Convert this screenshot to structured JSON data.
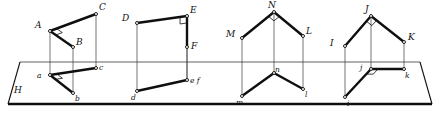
{
  "figure": {
    "plane_label": "H",
    "colors": {
      "ink": "#0f0f0f",
      "thin_line": "#3a3a3a",
      "background": "#ffffff"
    }
  },
  "plane": {
    "name": "horizontal-projection-plane",
    "label": "H",
    "top_edge": {
      "x1": 20,
      "y1": 62,
      "x2": 420,
      "y2": 62
    },
    "bottom_edge": {
      "x1": 8,
      "y1": 104,
      "x2": 432,
      "y2": 104
    },
    "left_edge": {
      "x1": 20,
      "y1": 62,
      "x2": 8,
      "y2": 104
    },
    "right_edge": {
      "x1": 420,
      "y1": 62,
      "x2": 432,
      "y2": 104
    },
    "label_pos": {
      "x": 14,
      "y": 92
    }
  },
  "groups": [
    {
      "id": "group-abc",
      "upper": {
        "vertices": [
          {
            "name": "A",
            "x": 50,
            "y": 31,
            "label_dx": -10,
            "label_dy": -4
          },
          {
            "name": "B",
            "x": 73,
            "y": 47,
            "label_dx": 3,
            "label_dy": -3
          },
          {
            "name": "C",
            "x": 96,
            "y": 14,
            "label_dx": 3,
            "label_dy": -5
          }
        ],
        "thick_edges": [
          [
            "A",
            "C"
          ],
          [
            "A",
            "B"
          ]
        ],
        "right_angle_at": "A"
      },
      "lower": {
        "vertices": [
          {
            "name": "a",
            "x": 50,
            "y": 75,
            "label_dx": -9,
            "label_dy": 2
          },
          {
            "name": "b",
            "x": 73,
            "y": 93,
            "label_dx": 2,
            "label_dy": 7
          },
          {
            "name": "c",
            "x": 96,
            "y": 68,
            "label_dx": 3,
            "label_dy": 1
          }
        ],
        "thick_edges": [
          [
            "a",
            "c"
          ],
          [
            "a",
            "b"
          ]
        ],
        "right_angle_at": "a"
      },
      "projectors": [
        [
          "A",
          "a"
        ],
        [
          "B",
          "b"
        ],
        [
          "C",
          "c"
        ]
      ]
    },
    {
      "id": "group-def",
      "upper": {
        "vertices": [
          {
            "name": "D",
            "x": 137,
            "y": 23,
            "label_dx": -10,
            "label_dy": -3
          },
          {
            "name": "E",
            "x": 187,
            "y": 16,
            "label_dx": 3,
            "label_dy": -4
          },
          {
            "name": "F",
            "x": 187,
            "y": 47,
            "label_dx": 4,
            "label_dy": 1
          }
        ],
        "thick_edges": [
          [
            "D",
            "E"
          ],
          [
            "E",
            "F"
          ]
        ],
        "right_angle_at": "E"
      },
      "lower": {
        "vertices": [
          {
            "name": "d",
            "x": 137,
            "y": 91,
            "label_dx": -2,
            "label_dy": 8
          },
          {
            "name": "e f",
            "x": 187,
            "y": 80,
            "label_dx": 3,
            "label_dy": 2
          }
        ],
        "thick_edges": [
          [
            "d",
            "e f"
          ]
        ],
        "right_angle_at": null
      },
      "projectors": [
        [
          "D",
          "d"
        ],
        [
          "E",
          "e f"
        ],
        [
          "F",
          "e f"
        ]
      ]
    },
    {
      "id": "group-mnl",
      "upper": {
        "vertices": [
          {
            "name": "M",
            "x": 242,
            "y": 38,
            "label_dx": -11,
            "label_dy": -2
          },
          {
            "name": "N",
            "x": 274,
            "y": 12,
            "label_dx": -1,
            "label_dy": -5
          },
          {
            "name": "L",
            "x": 303,
            "y": 36,
            "label_dx": 3,
            "label_dy": -3
          }
        ],
        "thick_edges": [
          [
            "M",
            "N"
          ],
          [
            "N",
            "L"
          ]
        ],
        "right_angle_at": "N"
      },
      "lower": {
        "vertices": [
          {
            "name": "m",
            "x": 242,
            "y": 96,
            "label_dx": -2,
            "label_dy": 8
          },
          {
            "name": "n",
            "x": 274,
            "y": 73,
            "label_dx": 1,
            "label_dy": -2
          },
          {
            "name": "l",
            "x": 303,
            "y": 89,
            "label_dx": 2,
            "label_dy": 7
          }
        ],
        "thick_edges": [
          [
            "m",
            "n"
          ],
          [
            "n",
            "l"
          ]
        ],
        "right_angle_at": null
      },
      "projectors": [
        [
          "M",
          "m"
        ],
        [
          "N",
          "n"
        ],
        [
          "L",
          "l"
        ]
      ]
    },
    {
      "id": "group-ijk",
      "upper": {
        "vertices": [
          {
            "name": "I",
            "x": 345,
            "y": 46,
            "label_dx": -10,
            "label_dy": -1
          },
          {
            "name": "J",
            "x": 371,
            "y": 16,
            "label_dx": -1,
            "label_dy": -5
          },
          {
            "name": "K",
            "x": 404,
            "y": 42,
            "label_dx": 4,
            "label_dy": -3
          }
        ],
        "thick_edges": [
          [
            "I",
            "J"
          ],
          [
            "J",
            "K"
          ]
        ],
        "right_angle_at": "J"
      },
      "lower": {
        "vertices": [
          {
            "name": "i",
            "x": 345,
            "y": 97,
            "label_dx": 2,
            "label_dy": 8
          },
          {
            "name": "j",
            "x": 371,
            "y": 69,
            "label_dx": -7,
            "label_dy": 0
          },
          {
            "name": "k",
            "x": 404,
            "y": 69,
            "label_dx": 1,
            "label_dy": 8
          }
        ],
        "thick_edges": [
          [
            "j",
            "i"
          ],
          [
            "j",
            "k"
          ]
        ],
        "right_angle_at": "j"
      },
      "projectors": [
        [
          "I",
          "i"
        ],
        [
          "J",
          "j"
        ],
        [
          "K",
          "k"
        ]
      ]
    }
  ]
}
